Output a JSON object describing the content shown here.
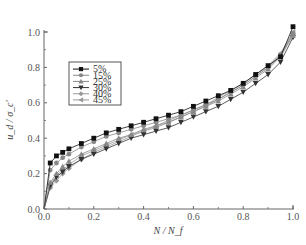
{
  "chart_data": {
    "type": "line",
    "title": "",
    "xlabel": "N / N_f",
    "ylabel": "u_d / σ_c'",
    "xlim": [
      0.0,
      1.0
    ],
    "ylim": [
      0.0,
      1.0
    ],
    "x_ticks": [
      "0.0",
      "0.2",
      "0.4",
      "0.6",
      "0.8",
      "1.0"
    ],
    "y_ticks": [
      "0.0",
      "0.2",
      "0.4",
      "0.6",
      "0.8",
      "1.0"
    ],
    "grid": false,
    "legend_position": "upper left",
    "series": [
      {
        "name": "5%",
        "marker": "square",
        "color": "#111111",
        "x": [
          0.0,
          0.025,
          0.05,
          0.075,
          0.1,
          0.15,
          0.2,
          0.25,
          0.3,
          0.35,
          0.4,
          0.45,
          0.5,
          0.55,
          0.6,
          0.65,
          0.7,
          0.75,
          0.8,
          0.85,
          0.9,
          0.95,
          1.0
        ],
        "y": [
          0.0,
          0.26,
          0.3,
          0.32,
          0.34,
          0.37,
          0.4,
          0.43,
          0.45,
          0.47,
          0.49,
          0.51,
          0.53,
          0.55,
          0.58,
          0.61,
          0.64,
          0.67,
          0.71,
          0.76,
          0.81,
          0.86,
          1.03
        ]
      },
      {
        "name": "15%",
        "marker": "circle",
        "color": "#888888",
        "x": [
          0.0,
          0.025,
          0.05,
          0.075,
          0.1,
          0.15,
          0.2,
          0.25,
          0.3,
          0.35,
          0.4,
          0.45,
          0.5,
          0.55,
          0.6,
          0.65,
          0.7,
          0.75,
          0.8,
          0.85,
          0.9,
          0.95,
          1.0
        ],
        "y": [
          0.0,
          0.22,
          0.26,
          0.29,
          0.31,
          0.35,
          0.38,
          0.41,
          0.43,
          0.45,
          0.47,
          0.49,
          0.51,
          0.53,
          0.56,
          0.59,
          0.62,
          0.66,
          0.7,
          0.75,
          0.8,
          0.87,
          0.99
        ]
      },
      {
        "name": "25%",
        "marker": "triangle-up",
        "color": "#888888",
        "x": [
          0.0,
          0.025,
          0.05,
          0.075,
          0.1,
          0.15,
          0.2,
          0.25,
          0.3,
          0.35,
          0.4,
          0.45,
          0.5,
          0.55,
          0.6,
          0.65,
          0.7,
          0.75,
          0.8,
          0.85,
          0.9,
          0.95,
          1.0
        ],
        "y": [
          0.0,
          0.15,
          0.2,
          0.24,
          0.27,
          0.31,
          0.34,
          0.37,
          0.4,
          0.42,
          0.45,
          0.47,
          0.49,
          0.52,
          0.55,
          0.58,
          0.61,
          0.65,
          0.69,
          0.74,
          0.79,
          0.86,
          0.98
        ]
      },
      {
        "name": "30%",
        "marker": "triangle-down",
        "color": "#333333",
        "x": [
          0.0,
          0.025,
          0.05,
          0.075,
          0.1,
          0.15,
          0.2,
          0.25,
          0.3,
          0.35,
          0.4,
          0.45,
          0.5,
          0.55,
          0.6,
          0.65,
          0.7,
          0.75,
          0.8,
          0.85,
          0.9,
          0.95,
          1.0
        ],
        "y": [
          0.0,
          0.13,
          0.18,
          0.21,
          0.24,
          0.28,
          0.31,
          0.34,
          0.37,
          0.4,
          0.42,
          0.44,
          0.46,
          0.49,
          0.52,
          0.55,
          0.58,
          0.62,
          0.66,
          0.71,
          0.76,
          0.83,
          0.97
        ]
      },
      {
        "name": "40%",
        "marker": "diamond",
        "color": "#999999",
        "x": [
          0.0,
          0.025,
          0.05,
          0.075,
          0.1,
          0.15,
          0.2,
          0.25,
          0.3,
          0.35,
          0.4,
          0.45,
          0.5,
          0.55,
          0.6,
          0.65,
          0.7,
          0.75,
          0.8,
          0.85,
          0.9,
          0.95,
          1.0
        ],
        "y": [
          0.0,
          0.12,
          0.16,
          0.2,
          0.23,
          0.28,
          0.32,
          0.35,
          0.38,
          0.41,
          0.44,
          0.46,
          0.49,
          0.52,
          0.55,
          0.58,
          0.62,
          0.66,
          0.7,
          0.75,
          0.8,
          0.87,
          0.99
        ]
      },
      {
        "name": "45%",
        "marker": "triangle-left",
        "color": "#999999",
        "x": [
          0.0,
          0.025,
          0.05,
          0.075,
          0.1,
          0.15,
          0.2,
          0.25,
          0.3,
          0.35,
          0.4,
          0.45,
          0.5,
          0.55,
          0.6,
          0.65,
          0.7,
          0.75,
          0.8,
          0.85,
          0.9,
          0.95,
          1.0
        ],
        "y": [
          0.0,
          0.14,
          0.19,
          0.22,
          0.25,
          0.3,
          0.33,
          0.36,
          0.39,
          0.42,
          0.44,
          0.47,
          0.5,
          0.53,
          0.56,
          0.59,
          0.63,
          0.67,
          0.71,
          0.76,
          0.81,
          0.88,
          1.0
        ]
      }
    ]
  },
  "layout": {
    "plot": {
      "left": 44,
      "right": 293,
      "top": 32,
      "bottom": 209
    },
    "legend": {
      "x": 69,
      "y": 62,
      "w": 52,
      "h": 43
    }
  }
}
